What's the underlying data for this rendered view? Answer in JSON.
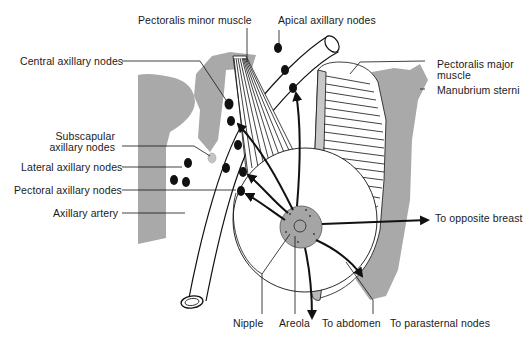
{
  "diagram": {
    "colors": {
      "bone": "#a9a9a9",
      "ink": "#111111",
      "background": "#ffffff"
    },
    "labels": {
      "pectoralis_minor": "Pectoralis minor muscle",
      "apical_nodes": "Apical axillary nodes",
      "central_nodes": "Central axillary nodes",
      "pectoralis_major_1": "Pectoralis major",
      "pectoralis_major_2": "muscle",
      "manubrium": "Manubrium sterni",
      "subscapular_1": "Subscapular",
      "subscapular_2": "axillary nodes",
      "lateral_nodes": "Lateral axillary nodes",
      "pectoral_nodes": "Pectoral axillary nodes",
      "axillary_artery": "Axillary artery",
      "opposite_breast": "To opposite breast",
      "nipple": "Nipple",
      "areola": "Areola",
      "abdomen": "To abdomen",
      "parasternal": "To parasternal nodes"
    }
  }
}
